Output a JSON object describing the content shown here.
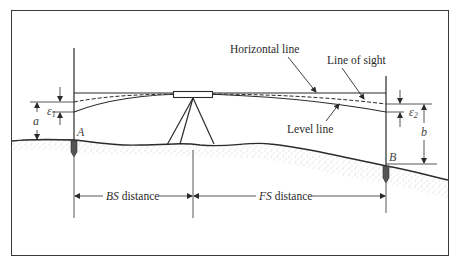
{
  "diagram": {
    "type": "leveling-curvature-refraction-figure",
    "labels": {
      "horizontal_line": "Horizontal line",
      "line_of_sight": "Line of sight",
      "level_line": "Level line",
      "point_a": "A",
      "point_b": "B",
      "epsilon_1": "ε",
      "epsilon_1_sub": "1",
      "epsilon_2": "ε",
      "epsilon_2_sub": "2",
      "dim_a": "a",
      "dim_b": "b",
      "bs_abbrev": "BS",
      "bs_rest": " distance",
      "fs_abbrev": "FS",
      "fs_rest": " distance"
    },
    "colors": {
      "line": "#2b2b2b",
      "ground_stipple": "#8a8a8a",
      "frame": "#3a3a3a",
      "background": "#ffffff"
    }
  }
}
